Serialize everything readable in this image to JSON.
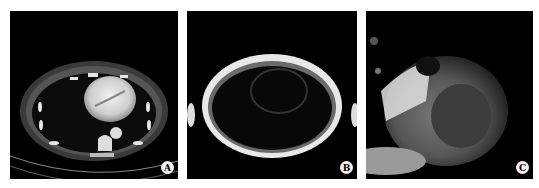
{
  "figure": {
    "panels": [
      {
        "label": "A",
        "description": "Axial contrast-enhanced CT of the chest at the level of the heart"
      },
      {
        "label": "B",
        "description": "Axial MRI of the chest with dark blood, bright subcutaneous fat"
      },
      {
        "label": "C",
        "description": "Cardiac MRI short-axis close-up view"
      }
    ]
  }
}
